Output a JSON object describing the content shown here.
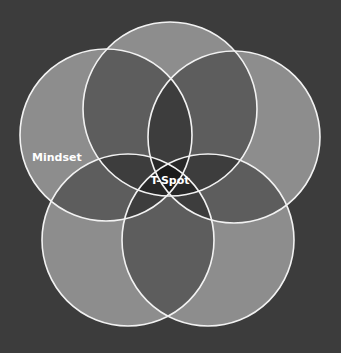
{
  "diagram": {
    "type": "five-circle venn",
    "colors": {
      "background": "#3c3c3c",
      "fill": "#d7d7d7",
      "stroke": "#f2f2f2"
    },
    "circles": [
      {
        "name": "top",
        "cx": 170,
        "cy": 109,
        "r": 87
      },
      {
        "name": "upper-left",
        "cx": 106,
        "cy": 135,
        "r": 86
      },
      {
        "name": "upper-right",
        "cx": 234,
        "cy": 137,
        "r": 86
      },
      {
        "name": "lower-left",
        "cx": 128,
        "cy": 240,
        "r": 86
      },
      {
        "name": "lower-right",
        "cx": 208,
        "cy": 240,
        "r": 86
      }
    ],
    "labels": {
      "mindset": "Mindset",
      "center": "T-Spot"
    }
  }
}
